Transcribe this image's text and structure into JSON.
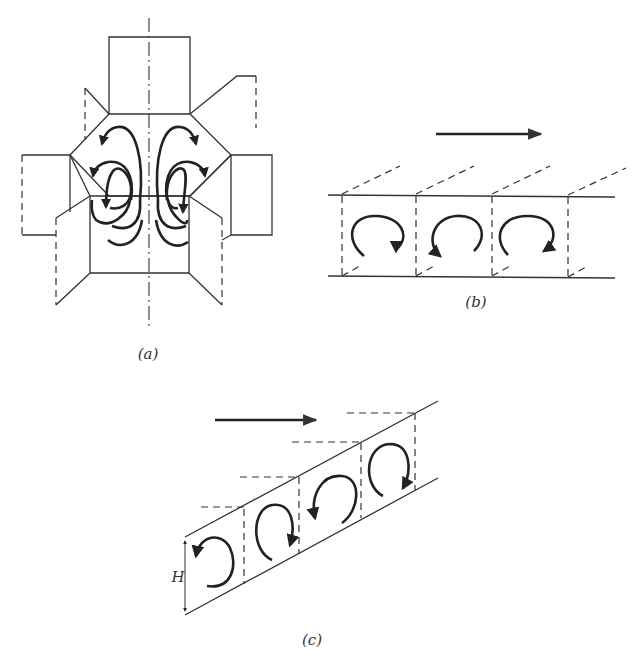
{
  "figure": {
    "panels": [
      {
        "id": "a",
        "label": "(a)",
        "description": "Cross-shaped unfolded hexagonal cell with symmetric vortex flow arrows about a dash-dot axis",
        "vortex_count": 8
      },
      {
        "id": "b",
        "label": "(b)",
        "description": "Horizontal channel divided into three cells by dashed walls, each with a circulating roll",
        "flow_direction": "right",
        "cell_count": 3
      },
      {
        "id": "c",
        "label": "(c)",
        "description": "Inclined channel of height H with four cells, alternating roll directions",
        "flow_direction": "right",
        "cell_count": 4,
        "dimension_label": "H"
      }
    ]
  },
  "colors": {
    "line": "#333333",
    "arrow": "#222222",
    "background": "#ffffff"
  }
}
